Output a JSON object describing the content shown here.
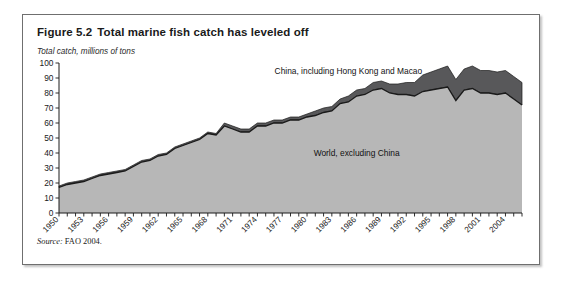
{
  "figure": {
    "number": "Figure 5.2",
    "title": "Total marine fish catch has leveled off",
    "axis_caption": "Total catch, millions of tons",
    "source_label": "Source:",
    "source_value": "FAO 2004."
  },
  "colors": {
    "world_fill": "#b7b7b7",
    "china_fill": "#58585a",
    "outline": "#1a1a1a",
    "border": "#6f6f6f"
  },
  "chart_data": {
    "type": "area",
    "stacked": true,
    "title": "Total marine fish catch has leveled off",
    "xlabel": "",
    "ylabel": "Total catch, millions of tons",
    "ylim": [
      0,
      100
    ],
    "xlim": [
      1950,
      2006
    ],
    "ytick_step": 10,
    "yticks": [
      0,
      10,
      20,
      30,
      40,
      50,
      60,
      70,
      80,
      90,
      100
    ],
    "xtick_step": 1,
    "xlabel_step": 3,
    "xticklabels": [
      "1950",
      "1953",
      "1956",
      "1959",
      "1962",
      "1965",
      "1968",
      "1971",
      "1974",
      "1977",
      "1980",
      "1983",
      "1986",
      "1989",
      "1992",
      "1995",
      "1998",
      "2001",
      "2004"
    ],
    "grid": false,
    "legend_position": "inline-annotations",
    "annotations": [
      {
        "text": "China, including Hong Kong and Macao",
        "x": 1985,
        "y": 93
      },
      {
        "text": "World, excluding China",
        "x": 1986,
        "y": 38
      }
    ],
    "x": [
      1950,
      1951,
      1952,
      1953,
      1954,
      1955,
      1956,
      1957,
      1958,
      1959,
      1960,
      1961,
      1962,
      1963,
      1964,
      1965,
      1966,
      1967,
      1968,
      1969,
      1970,
      1971,
      1972,
      1973,
      1974,
      1975,
      1976,
      1977,
      1978,
      1979,
      1980,
      1981,
      1982,
      1983,
      1984,
      1985,
      1986,
      1987,
      1988,
      1989,
      1990,
      1991,
      1992,
      1993,
      1994,
      1995,
      1996,
      1997,
      1998,
      1999,
      2000,
      2001,
      2002,
      2003,
      2004,
      2005,
      2006
    ],
    "series": [
      {
        "name": "World, excluding China",
        "values": [
          17,
          19,
          20,
          21,
          23,
          25,
          26,
          27,
          28,
          31,
          34,
          35,
          38,
          39,
          43,
          45,
          47,
          49,
          53,
          52,
          58,
          56,
          54,
          54,
          58,
          58,
          60,
          60,
          62,
          62,
          64,
          65,
          67,
          68,
          73,
          74,
          78,
          79,
          82,
          83,
          80,
          79,
          79,
          78,
          81,
          82,
          83,
          84,
          75,
          82,
          83,
          80,
          80,
          79,
          80,
          76,
          72
        ]
      },
      {
        "name": "China, including Hong Kong and Macao",
        "values": [
          1,
          1,
          1,
          1,
          1,
          1,
          1,
          1,
          1,
          1,
          1,
          1,
          1,
          1,
          1,
          1,
          1,
          1,
          1,
          1,
          2,
          2,
          2,
          2,
          2,
          2,
          2,
          2,
          2,
          2,
          2,
          3,
          3,
          3,
          3,
          4,
          4,
          4,
          5,
          5,
          6,
          7,
          8,
          9,
          11,
          12,
          13,
          14,
          14,
          14,
          15,
          15,
          15,
          15,
          15,
          15,
          15
        ]
      }
    ]
  }
}
